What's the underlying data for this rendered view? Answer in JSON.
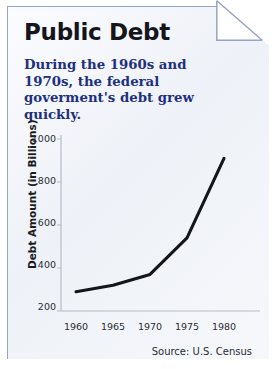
{
  "card": {
    "title": "Public Debt",
    "subtitle": "During the 1960s and 1970s, the federal goverment's debt grew quickly.",
    "source": "Source: U.S. Census",
    "fold_icon": "page-fold-corner",
    "colors": {
      "panel_bg": "#f2f4f9",
      "border": "#9aa3c4",
      "title": "#14161c",
      "subtitle": "#20307e",
      "line": "#15161a",
      "axis": "#b6bcc9"
    }
  },
  "chart_data": {
    "type": "line",
    "title": "Public Debt",
    "xlabel": "",
    "ylabel": "Debt Amount (in Billions)",
    "x": [
      1960,
      1965,
      1970,
      1975,
      1980
    ],
    "xtick_labels": [
      "1960",
      "1965",
      "1970",
      "1975",
      "1980"
    ],
    "ytick_labels": [
      "200",
      "400",
      "600",
      "800",
      "1000"
    ],
    "yticks": [
      200,
      400,
      600,
      800,
      1000
    ],
    "values": [
      290,
      320,
      370,
      540,
      910
    ],
    "series": [
      {
        "name": "Public Debt",
        "values": [
          290,
          320,
          370,
          540,
          910
        ]
      }
    ],
    "xlim": [
      1958,
      1982
    ],
    "ylim": [
      200,
      1000
    ],
    "grid": false,
    "legend": "none",
    "annotation": "Source: U.S. Census"
  }
}
